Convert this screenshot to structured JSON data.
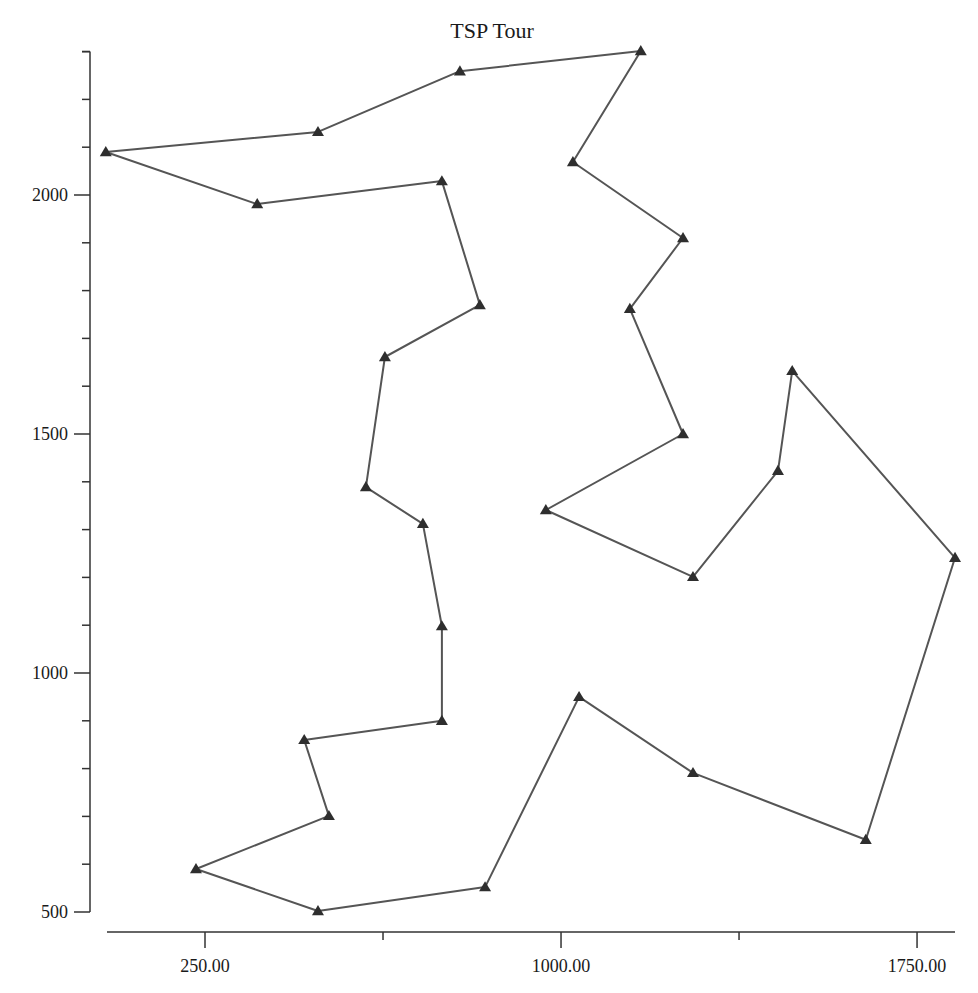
{
  "chart_data": {
    "type": "line",
    "title": "TSP Tour",
    "xlabel": "",
    "ylabel": "",
    "xlim": [
      20,
      1855
    ],
    "ylim": [
      470,
      2300
    ],
    "grid": false,
    "legend": null,
    "marker": "triangle",
    "closed_path": true,
    "x_ticks": {
      "major": [
        250,
        1000,
        1750
      ],
      "major_labels": [
        "250.00",
        "1000.00",
        "1750.00"
      ],
      "minor": [
        625,
        1375
      ]
    },
    "y_ticks": {
      "major": [
        500,
        1000,
        1500,
        2000
      ],
      "major_labels": [
        "500",
        "1000",
        "1500",
        "2000"
      ],
      "minor": [
        600,
        700,
        800,
        900,
        1100,
        1200,
        1300,
        1400,
        1600,
        1700,
        1800,
        1900,
        2100,
        2200,
        2300
      ]
    },
    "series": [
      {
        "name": "tour",
        "points": [
          {
            "x": 41,
            "y": 2090
          },
          {
            "x": 488,
            "y": 2132
          },
          {
            "x": 787,
            "y": 2259
          },
          {
            "x": 1168,
            "y": 2301
          },
          {
            "x": 1025,
            "y": 2069
          },
          {
            "x": 1257,
            "y": 1910
          },
          {
            "x": 1145,
            "y": 1762
          },
          {
            "x": 1257,
            "y": 1500
          },
          {
            "x": 968,
            "y": 1341
          },
          {
            "x": 1278,
            "y": 1201
          },
          {
            "x": 1457,
            "y": 1423
          },
          {
            "x": 1487,
            "y": 1632
          },
          {
            "x": 1830,
            "y": 1241
          },
          {
            "x": 1642,
            "y": 651
          },
          {
            "x": 1278,
            "y": 791
          },
          {
            "x": 1038,
            "y": 950
          },
          {
            "x": 840,
            "y": 552
          },
          {
            "x": 488,
            "y": 502
          },
          {
            "x": 231,
            "y": 590
          },
          {
            "x": 511,
            "y": 701
          },
          {
            "x": 459,
            "y": 860
          },
          {
            "x": 749,
            "y": 900
          },
          {
            "x": 749,
            "y": 1098
          },
          {
            "x": 709,
            "y": 1312
          },
          {
            "x": 589,
            "y": 1389
          },
          {
            "x": 629,
            "y": 1661
          },
          {
            "x": 829,
            "y": 1770
          },
          {
            "x": 749,
            "y": 2029
          },
          {
            "x": 360,
            "y": 1981
          }
        ]
      }
    ]
  },
  "colors": {
    "line": "#555555",
    "marker": "#2e2e2e",
    "axis": "#333333",
    "text": "#1a1a1a",
    "background": "#ffffff"
  }
}
